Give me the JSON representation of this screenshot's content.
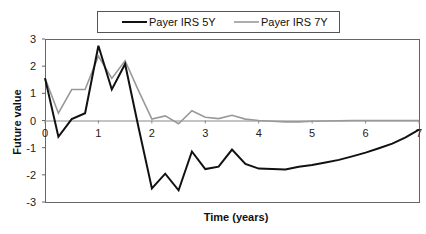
{
  "chart_data": {
    "type": "line",
    "title": "",
    "xlabel": "Time (years)",
    "ylabel": "Future value",
    "xlim": [
      0,
      7
    ],
    "ylim": [
      -3,
      3
    ],
    "x_ticks": [
      0,
      1,
      2,
      3,
      4,
      5,
      6,
      7
    ],
    "y_ticks": [
      3,
      2,
      1,
      0,
      -1,
      -2,
      -3
    ],
    "grid": false,
    "legend_position": "top",
    "series": [
      {
        "name": "Payer IRS 5Y",
        "color": "#111111",
        "width": 2,
        "x": [
          0,
          0.25,
          0.5,
          0.75,
          1.0,
          1.25,
          1.5,
          1.75,
          2.0,
          2.25,
          2.5,
          2.75,
          3.0,
          3.25,
          3.5,
          3.75,
          4.0,
          4.25,
          4.5,
          4.75,
          5.0,
          5.25,
          5.5,
          5.75,
          6.0,
          6.25,
          6.5,
          6.75,
          7.0
        ],
        "values": [
          1.56,
          -0.6,
          0.05,
          0.27,
          2.75,
          1.14,
          2.08,
          -0.25,
          -2.5,
          -1.96,
          -2.57,
          -1.14,
          -1.79,
          -1.7,
          -1.07,
          -1.6,
          -1.77,
          -1.79,
          -1.8,
          -1.7,
          -1.64,
          -1.55,
          -1.45,
          -1.32,
          -1.18,
          -1.02,
          -0.85,
          -0.62,
          -0.34
        ]
      },
      {
        "name": "Payer IRS 7Y",
        "color": "#999999",
        "width": 1.6,
        "x": [
          0,
          0.25,
          0.5,
          0.75,
          1.0,
          1.25,
          1.5,
          1.75,
          2.0,
          2.25,
          2.5,
          2.75,
          3.0,
          3.25,
          3.5,
          3.75,
          4.0,
          4.25,
          4.5,
          4.75,
          5.0,
          5.25,
          5.5,
          5.75,
          6.0,
          6.25,
          6.5,
          6.75,
          7.0
        ],
        "values": [
          1.56,
          0.27,
          1.14,
          1.14,
          2.37,
          1.55,
          2.2,
          1.1,
          0.05,
          0.17,
          -0.12,
          0.36,
          0.12,
          0.07,
          0.19,
          0.05,
          0.0,
          -0.03,
          -0.05,
          -0.05,
          -0.03,
          -0.02,
          -0.01,
          0.0,
          0.0,
          0.0,
          0.0,
          0.0,
          0.0
        ]
      }
    ]
  },
  "legend": {
    "items": [
      {
        "label": "Payer IRS 5Y",
        "color": "#111111"
      },
      {
        "label": "Payer IRS 7Y",
        "color": "#999999"
      }
    ]
  },
  "axes": {
    "x_title": "Time (years)",
    "y_title": "Future value"
  }
}
